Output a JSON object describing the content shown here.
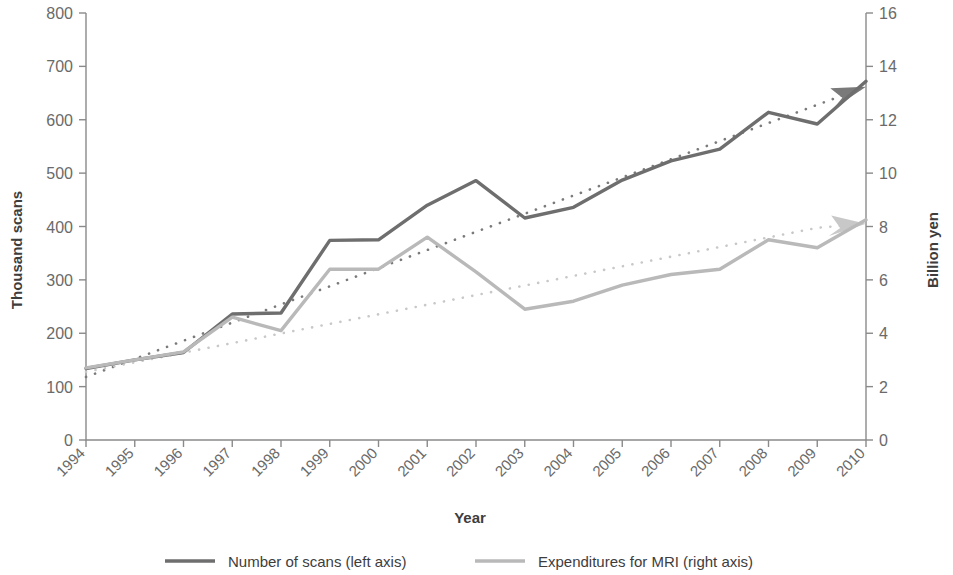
{
  "chart_data": {
    "type": "line",
    "title": "",
    "xlabel": "Year",
    "ylabel": "Thousand scans",
    "y2label": "Billion yen",
    "grid": false,
    "legend_position": "bottom",
    "categories": [
      "1994",
      "1995",
      "1996",
      "1997",
      "1998",
      "1999",
      "2000",
      "2001",
      "2002",
      "2003",
      "2004",
      "2005",
      "2006",
      "2007",
      "2008",
      "2009",
      "2010"
    ],
    "ylim": [
      0,
      800
    ],
    "yticks": [
      0,
      100,
      200,
      300,
      400,
      500,
      600,
      700,
      800
    ],
    "y2lim": [
      0,
      16
    ],
    "y2ticks": [
      0,
      2,
      4,
      6,
      8,
      10,
      12,
      14,
      16
    ],
    "series": [
      {
        "name": "Number of scans (left axis)",
        "axis": "left",
        "unit": "thousand scans",
        "color": "#6e6e6e",
        "style": "solid",
        "values": [
          134,
          150,
          164,
          236,
          238,
          374,
          375,
          440,
          486,
          416,
          436,
          487,
          523,
          545,
          614,
          592,
          672
        ]
      },
      {
        "name": "Expenditures for MRI (right axis)",
        "axis": "right",
        "unit": "billion yen",
        "color": "#b9b9b9",
        "style": "solid",
        "values": [
          2.7,
          3.0,
          3.3,
          4.6,
          4.1,
          6.4,
          6.4,
          7.6,
          6.3,
          4.9,
          5.2,
          5.8,
          6.2,
          6.4,
          7.5,
          7.2,
          8.25
        ]
      },
      {
        "name": "Trend (number of scans)",
        "axis": "left",
        "color": "#7a7a7a",
        "style": "dotted-arrow",
        "values": [
          118,
          152,
          186,
          220,
          254,
          288,
          322,
          356,
          390,
          424,
          458,
          492,
          526,
          560,
          594,
          628,
          662
        ]
      },
      {
        "name": "Trend (expenditures for MRI)",
        "axis": "right",
        "color": "#c8c8c8",
        "style": "dotted-arrow",
        "values": [
          2.55,
          2.91,
          3.27,
          3.63,
          3.99,
          4.35,
          4.71,
          5.07,
          5.43,
          5.79,
          6.15,
          6.51,
          6.87,
          7.23,
          7.59,
          7.95,
          8.1
        ]
      }
    ]
  },
  "axes": {
    "left_title": "Thousand scans",
    "right_title": "Billion yen",
    "x_title": "Year",
    "left_ticks": [
      "0",
      "100",
      "200",
      "300",
      "400",
      "500",
      "600",
      "700",
      "800"
    ],
    "right_ticks": [
      "0",
      "2",
      "4",
      "6",
      "8",
      "10",
      "12",
      "14",
      "16"
    ],
    "x_ticks": [
      "1994",
      "1995",
      "1996",
      "1997",
      "1998",
      "1999",
      "2000",
      "2001",
      "2002",
      "2003",
      "2004",
      "2005",
      "2006",
      "2007",
      "2008",
      "2009",
      "2010"
    ]
  },
  "legend": {
    "items": [
      {
        "label": "Number of scans (left axis)",
        "color": "#6e6e6e"
      },
      {
        "label": "Expenditures for MRI (right axis)",
        "color": "#b9b9b9"
      }
    ]
  },
  "colors": {
    "series_dark": "#6e6e6e",
    "series_light": "#b9b9b9",
    "axis": "#8a8a8a",
    "text": "#4a4a4a",
    "background": "#ffffff"
  }
}
